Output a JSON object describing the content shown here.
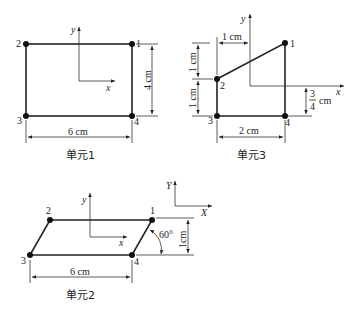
{
  "element1": {
    "caption": "单元1",
    "nodes": [
      "1",
      "2",
      "3",
      "4"
    ],
    "width_label": "6 cm",
    "height_label": "4 cm",
    "x_axis": "x",
    "y_axis": "y"
  },
  "element3": {
    "caption": "单元3",
    "nodes": [
      "1",
      "2",
      "3",
      "4"
    ],
    "offset_label": "1 cm",
    "upper_height_label": "1 cm",
    "lower_height_label": "1 cm",
    "width_label": "2 cm",
    "frac_num": "3",
    "frac_den": "4",
    "frac_unit": "cm",
    "x_axis": "x",
    "y_axis": "y"
  },
  "global_axes": {
    "x": "X",
    "y": "Y"
  },
  "element2": {
    "caption": "单元2",
    "nodes": [
      "1",
      "2",
      "3",
      "4"
    ],
    "width_label": "6 cm",
    "height_label": "1cm",
    "angle_label": "60°",
    "x_axis": "x",
    "y_axis": "y"
  }
}
